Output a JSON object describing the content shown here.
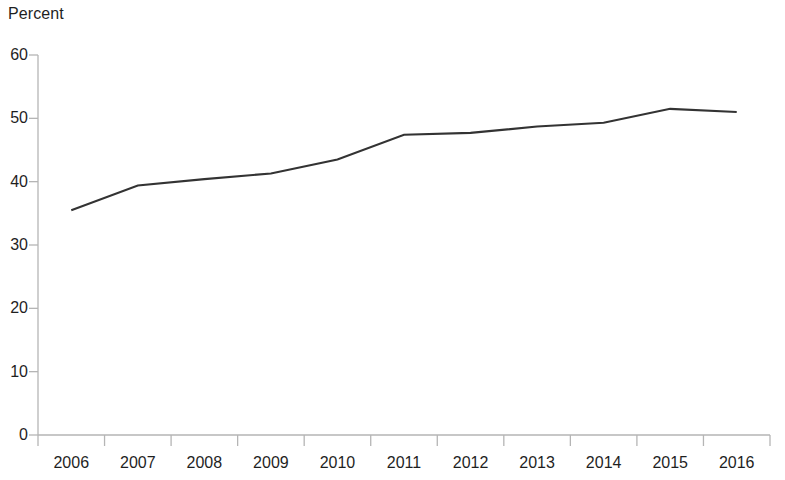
{
  "chart_data": {
    "type": "line",
    "title": "",
    "subtitle": "",
    "xlabel": "",
    "ylabel": "Percent",
    "ylim": [
      0,
      60
    ],
    "yticks": [
      0,
      10,
      20,
      30,
      40,
      50,
      60
    ],
    "grid": false,
    "legend": null,
    "categories": [
      "2006",
      "2007",
      "2008",
      "2009",
      "2010",
      "2011",
      "2012",
      "2013",
      "2014",
      "2015",
      "2016"
    ],
    "x": [
      2006,
      2007,
      2008,
      2009,
      2010,
      2011,
      2012,
      2013,
      2014,
      2015,
      2016
    ],
    "values": [
      35.5,
      39.4,
      40.4,
      41.3,
      43.5,
      47.4,
      47.7,
      48.7,
      49.3,
      51.5,
      51.0
    ],
    "series": [
      {
        "name": "Percent",
        "color": "#333333",
        "values": [
          35.5,
          39.4,
          40.4,
          41.3,
          43.5,
          47.4,
          47.7,
          48.7,
          49.3,
          51.5,
          51.0
        ]
      }
    ],
    "annotations": []
  },
  "colors": {
    "line": "#333333",
    "axis": "#b5b5b5",
    "tick": "#b5b5b5",
    "text": "#1f1f1f",
    "background": "#ffffff"
  },
  "axes": {
    "y_title": "Percent",
    "y_labels": [
      "60",
      "50",
      "40",
      "30",
      "20",
      "10",
      "0"
    ],
    "x_labels": [
      "2006",
      "2007",
      "2008",
      "2009",
      "2010",
      "2011",
      "2012",
      "2013",
      "2014",
      "2015",
      "2016"
    ]
  }
}
